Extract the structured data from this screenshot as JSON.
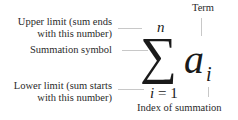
{
  "diagram": {
    "formula": {
      "symbol": "∑",
      "upper_limit": "n",
      "lower_limit_var": "i",
      "lower_limit_eq": "=",
      "lower_limit_val": "1",
      "term_base": "a",
      "term_sub": "i"
    },
    "labels": {
      "upper_limit_line1": "Upper limit (sum ends",
      "upper_limit_line2": "with this number)",
      "summation_symbol": "Summation symbol",
      "lower_limit_line1": "Lower limit (sum starts",
      "lower_limit_line2": "with this number)",
      "term": "Term",
      "index": "Index of summation"
    },
    "colors": {
      "text": "#2a2a2a",
      "math": "#1a1a1a",
      "connector": "#c8c8c8",
      "background": "#ffffff"
    }
  }
}
